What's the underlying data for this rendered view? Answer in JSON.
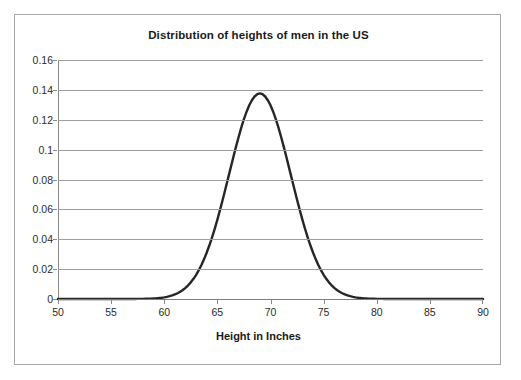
{
  "chart_data": {
    "type": "line",
    "title": "Distribution of heights of men in the US",
    "xlabel": "Height in Inches",
    "ylabel": "",
    "xlim": [
      50,
      90
    ],
    "ylim": [
      0,
      0.16
    ],
    "grid": true,
    "legend": "none",
    "curve_color": "#262626",
    "gridline_color": "#9d9d9d",
    "axis_color": "#8a8a8a",
    "distribution": {
      "kind": "normal",
      "mean": 69,
      "std_dev": 2.9,
      "peak_value": 0.1376,
      "peak_x": 69
    },
    "x_ticks": [
      50,
      55,
      60,
      65,
      70,
      75,
      80,
      85,
      90
    ],
    "x_tick_labels": [
      "50",
      "55",
      "60",
      "65",
      "70",
      "75",
      "80",
      "85",
      "90"
    ],
    "y_ticks": [
      0,
      0.02,
      0.04,
      0.06,
      0.08,
      0.1,
      0.12,
      0.14,
      0.16
    ],
    "y_tick_labels": [
      "0",
      "0.02",
      "0.04",
      "0.06",
      "0.08",
      "0.1",
      "0.12",
      "0.14",
      "0.16"
    ],
    "x": [
      50,
      51,
      52,
      53,
      54,
      55,
      56,
      57,
      58,
      59,
      60,
      61,
      62,
      63,
      64,
      65,
      66,
      67,
      68,
      69,
      70,
      71,
      72,
      73,
      74,
      75,
      76,
      77,
      78,
      79,
      80,
      81,
      82,
      83,
      84,
      85,
      86,
      87,
      88,
      89,
      90
    ],
    "values": [
      0.0,
      0.0,
      0.0,
      0.0,
      0.0,
      0.0,
      0.0001,
      0.0002,
      0.0006,
      0.0016,
      0.0036,
      0.0074,
      0.0139,
      0.0236,
      0.0366,
      0.0516,
      0.0665,
      0.0781,
      0.0836,
      0.1376,
      0.1303,
      0.1182,
      0.0979,
      0.0738,
      0.0508,
      0.032,
      0.0184,
      0.0096,
      0.0046,
      0.002,
      0.0008,
      0.0003,
      0.0001,
      0.0,
      0.0,
      0.0,
      0.0,
      0.0,
      0.0,
      0.0,
      0.0
    ]
  }
}
